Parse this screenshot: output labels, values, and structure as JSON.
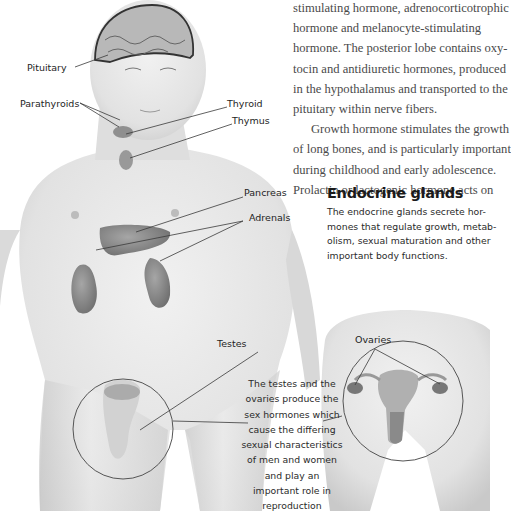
{
  "body_text": {
    "lines": [
      "stimulating hormone, adrenocorticotrophic",
      "hormone and melanocyte-stimulating",
      "hormone. The posterior lobe contains oxy-",
      "tocin and antidiuretic hormones, produced",
      "in the hypothalamus and transported to the",
      "pituitary within nerve fibers."
    ],
    "paragraph2_lines": [
      "Growth hormone stimulates the growth",
      "of long bones, and is particularly important",
      "during childhood and early adolescence.",
      "Prolactin or lactogenic hormone acts on"
    ]
  },
  "sidebar": {
    "title": "Endocrine glands",
    "lines": [
      "The endocrine glands secrete hor-",
      "mones that regulate growth, metab-",
      "olism, sexual maturation and other",
      "important body functions."
    ]
  },
  "labels": {
    "pituitary": "Pituitary",
    "parathyroids": "Parathyroids",
    "thyroid": "Thyroid",
    "thymus": "Thymus",
    "pancreas": "Pancreas",
    "adrenals": "Adrenals",
    "testes": "Testes",
    "ovaries": "Ovaries"
  },
  "caption": {
    "lines": [
      "The testes and the",
      "ovaries produce the",
      "sex hormones which",
      "cause the differing",
      "sexual characteristics",
      "of men and women",
      "and play an",
      "important role in",
      "reproduction"
    ]
  },
  "colors": {
    "skin": "#e6e6e6",
    "skin_shadow": "#cfcfcf",
    "organ": "#8c8c8c",
    "leader_line": "#3a3a3a",
    "text": "#4a4a4a"
  }
}
